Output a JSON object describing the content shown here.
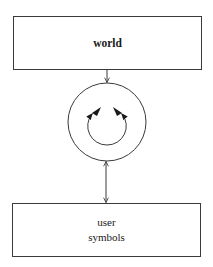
{
  "diagram": {
    "title": "",
    "nodes": [
      {
        "id": "world",
        "label_lines": [
          "world"
        ],
        "shape": "rectangle"
      },
      {
        "id": "loop",
        "label_lines": [],
        "shape": "circle-with-inner-cycle"
      },
      {
        "id": "user_symbols",
        "label_lines": [
          "user",
          "symbols"
        ],
        "shape": "rectangle"
      }
    ],
    "edges": [
      {
        "from": "world",
        "to": "loop",
        "direction": "one-way"
      },
      {
        "from": "loop",
        "to": "user_symbols",
        "direction": "two-way"
      }
    ],
    "inner_cycle": {
      "arrowheads": 2,
      "description": "circular loop with two arrowheads meeting at top"
    }
  },
  "colors": {
    "stroke": "#3a3a3a",
    "background": "#ffffff",
    "text": "#1a1a1a"
  }
}
